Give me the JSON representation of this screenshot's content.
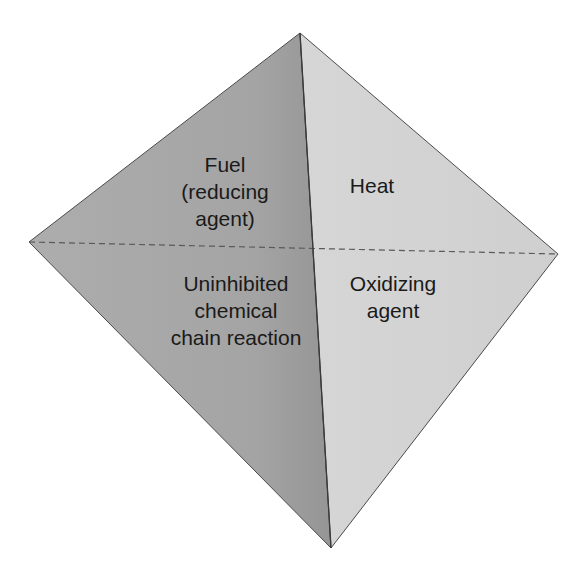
{
  "diagram": {
    "type": "fire tetrahedron",
    "vertices": {
      "top": [
        300,
        33
      ],
      "left": [
        29,
        242
      ],
      "right": [
        558,
        254
      ],
      "bottom": [
        331,
        548
      ]
    },
    "colors": {
      "left_face": "#a8a8a8",
      "left_face_dark": "#9c9c9c",
      "right_face": "#d2d2d2",
      "edge": "#4a4a4a",
      "dashed_edge": "#5a5a5a",
      "text": "#1a1a1a"
    },
    "faces": [
      {
        "id": "fuel",
        "lines": [
          "Fuel",
          "(reducing",
          "agent)"
        ]
      },
      {
        "id": "heat",
        "lines": [
          "Heat"
        ]
      },
      {
        "id": "chain-reaction",
        "lines": [
          "Uninhibited",
          "chemical",
          "chain reaction"
        ]
      },
      {
        "id": "oxidizing-agent",
        "lines": [
          "Oxidizing",
          "agent"
        ]
      }
    ]
  }
}
